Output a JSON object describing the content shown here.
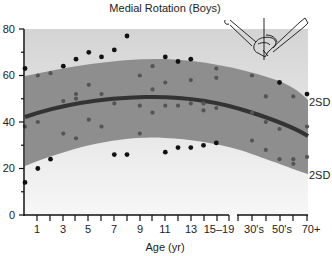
{
  "chart_data": {
    "type": "scatter",
    "title": "Medial Rotation (Boys)",
    "xlabel": "Age (yr)",
    "ylabel": "",
    "ylim": [
      0,
      80
    ],
    "yticks": [
      0,
      20,
      40,
      60,
      80
    ],
    "yminor_ticks": [
      10,
      30,
      50,
      70
    ],
    "x_tick_labels": [
      "1",
      "3",
      "5",
      "7",
      "9",
      "11",
      "13",
      "15–19",
      "30's",
      "50's",
      "70+"
    ],
    "x_axis_break": "between 15–19 and 30's",
    "grid": false,
    "legend": null,
    "annotations": [
      "2SD",
      "2SD"
    ],
    "band": {
      "label": "±2SD",
      "upper": [
        {
          "x": 0,
          "y": 60
        },
        {
          "x": 9,
          "y": 67
        },
        {
          "x": 15,
          "y": 64
        },
        {
          "x": 70,
          "y": 50
        }
      ],
      "mean": [
        {
          "x": 0,
          "y": 42
        },
        {
          "x": 9,
          "y": 50
        },
        {
          "x": 15,
          "y": 48
        },
        {
          "x": 70,
          "y": 34
        }
      ],
      "lower": [
        {
          "x": 0,
          "y": 22
        },
        {
          "x": 11,
          "y": 33
        },
        {
          "x": 15,
          "y": 32
        },
        {
          "x": 70,
          "y": 18
        }
      ]
    },
    "points": [
      {
        "x": 0,
        "y": 63
      },
      {
        "x": 0,
        "y": 14
      },
      {
        "x": 0,
        "y": 38
      },
      {
        "x": 1,
        "y": 60
      },
      {
        "x": 1,
        "y": 20
      },
      {
        "x": 1,
        "y": 40
      },
      {
        "x": 2,
        "y": 61
      },
      {
        "x": 2,
        "y": 24
      },
      {
        "x": 3,
        "y": 64
      },
      {
        "x": 3,
        "y": 35
      },
      {
        "x": 3,
        "y": 49
      },
      {
        "x": 4,
        "y": 67
      },
      {
        "x": 4,
        "y": 33
      },
      {
        "x": 4,
        "y": 52
      },
      {
        "x": 4,
        "y": 50
      },
      {
        "x": 5,
        "y": 70
      },
      {
        "x": 5,
        "y": 56
      },
      {
        "x": 5,
        "y": 41
      },
      {
        "x": 6,
        "y": 68
      },
      {
        "x": 6,
        "y": 52
      },
      {
        "x": 6,
        "y": 38
      },
      {
        "x": 7,
        "y": 71
      },
      {
        "x": 7,
        "y": 48
      },
      {
        "x": 7,
        "y": 26
      },
      {
        "x": 8,
        "y": 77
      },
      {
        "x": 8,
        "y": 26
      },
      {
        "x": 9,
        "y": 60
      },
      {
        "x": 9,
        "y": 47
      },
      {
        "x": 9,
        "y": 35
      },
      {
        "x": 10,
        "y": 64
      },
      {
        "x": 10,
        "y": 54
      },
      {
        "x": 10,
        "y": 44
      },
      {
        "x": 11,
        "y": 68
      },
      {
        "x": 11,
        "y": 57
      },
      {
        "x": 11,
        "y": 47
      },
      {
        "x": 11,
        "y": 27
      },
      {
        "x": 12,
        "y": 66
      },
      {
        "x": 12,
        "y": 47
      },
      {
        "x": 12,
        "y": 29
      },
      {
        "x": 13,
        "y": 67
      },
      {
        "x": 13,
        "y": 58
      },
      {
        "x": 13,
        "y": 48
      },
      {
        "x": 13,
        "y": 29
      },
      {
        "x": 14,
        "y": 48
      },
      {
        "x": 14,
        "y": 45
      },
      {
        "x": 14,
        "y": 30
      },
      {
        "x": 15,
        "y": 63
      },
      {
        "x": 15,
        "y": 59
      },
      {
        "x": 15,
        "y": 46
      },
      {
        "x": 15,
        "y": 31
      },
      {
        "x": 30,
        "y": 60
      },
      {
        "x": 30,
        "y": 32
      },
      {
        "x": 30,
        "y": 44
      },
      {
        "x": 40,
        "y": 51
      },
      {
        "x": 40,
        "y": 28
      },
      {
        "x": 40,
        "y": 40
      },
      {
        "x": 50,
        "y": 57
      },
      {
        "x": 50,
        "y": 24
      },
      {
        "x": 50,
        "y": 37
      },
      {
        "x": 60,
        "y": 51
      },
      {
        "x": 60,
        "y": 24
      },
      {
        "x": 60,
        "y": 22
      },
      {
        "x": 70,
        "y": 52
      },
      {
        "x": 70,
        "y": 25
      },
      {
        "x": 70,
        "y": 38
      }
    ]
  },
  "labels": {
    "title": "Medial Rotation (Boys)",
    "xlabel": "Age (yr)",
    "sd_upper": "2SD",
    "sd_lower": "2SD",
    "y_ticks": [
      "0",
      "20",
      "40",
      "60",
      "80"
    ],
    "x_ticks": [
      "1",
      "3",
      "5",
      "7",
      "9",
      "11",
      "13",
      "15–19",
      "30's",
      "50's",
      "70+"
    ]
  },
  "colors": {
    "band": "#8e8e8e",
    "mean_line": "#333333",
    "point_outside": "#111111",
    "point_inside": "#555555",
    "background_top": "#d2d2d2",
    "background_bottom": "#f3f3f3"
  },
  "illustration": {
    "description": "legs-flexed medial rotation diagram"
  }
}
